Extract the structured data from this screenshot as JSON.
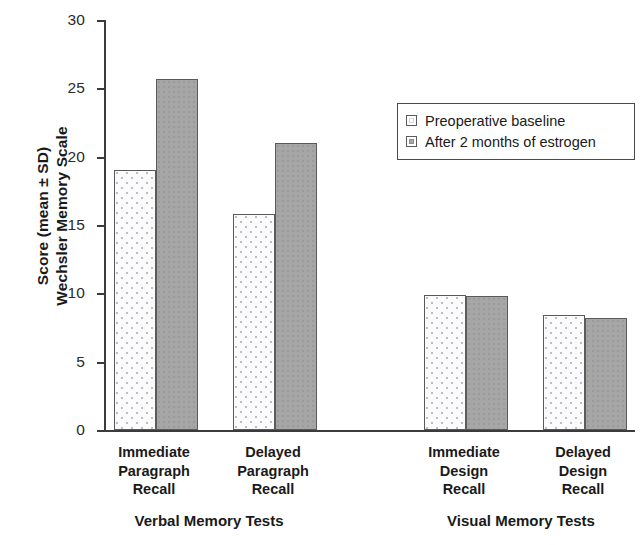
{
  "chart_data": {
    "type": "bar",
    "title": "",
    "xlabel": "",
    "ylabel_lines": [
      "Score (mean ± SD)",
      "Wechsler Memory Scale"
    ],
    "ylim": [
      0,
      30
    ],
    "yticks": [
      0,
      5,
      10,
      15,
      20,
      25,
      30
    ],
    "ytick_labels": [
      "0",
      "5",
      "10",
      "15",
      "20",
      "25",
      "30"
    ],
    "grid": false,
    "legend_position": "upper right",
    "categories": [
      "Immediate Paragraph Recall",
      "Delayed Paragraph Recall",
      "Immediate Design Recall",
      "Delayed Design Recall"
    ],
    "category_label_lines": [
      [
        "Immediate",
        "Paragraph",
        "Recall"
      ],
      [
        "Delayed",
        "Paragraph",
        "Recall"
      ],
      [
        "Immediate",
        "Design",
        "Recall"
      ],
      [
        "Delayed",
        "Design",
        "Recall"
      ]
    ],
    "groups": [
      {
        "name": "Verbal Memory Tests",
        "categories": [
          0,
          1
        ]
      },
      {
        "name": "Visual Memory Tests",
        "categories": [
          2,
          3
        ]
      }
    ],
    "series": [
      {
        "name": "Preoperative baseline",
        "key": "baseline",
        "color": "#fbfbfb",
        "values": [
          19.0,
          15.8,
          9.9,
          8.4
        ]
      },
      {
        "name": "After 2 months of estrogen",
        "key": "estrogen",
        "color": "#a6a6a6",
        "values": [
          25.7,
          21.0,
          9.8,
          8.2
        ]
      }
    ]
  },
  "legend": {
    "items": [
      {
        "label": "Preoperative baseline",
        "swatch": "light-dotted-square"
      },
      {
        "label": "After 2 months of estrogen",
        "swatch": "gray-square"
      }
    ]
  },
  "axes": {
    "y_title_line1": "Score (mean ± SD)",
    "y_title_line2": "Wechsler Memory Scale",
    "y_ticks": [
      "30",
      "25",
      "20",
      "15",
      "10",
      "5",
      "0"
    ]
  },
  "x_categories": [
    {
      "line1": "Immediate",
      "line2": "Paragraph",
      "line3": "Recall"
    },
    {
      "line1": "Delayed",
      "line2": "Paragraph",
      "line3": "Recall"
    },
    {
      "line1": "Immediate",
      "line2": "Design",
      "line3": "Recall"
    },
    {
      "line1": "Delayed",
      "line2": "Design",
      "line3": "Recall"
    }
  ],
  "x_groups": [
    {
      "label": "Verbal Memory Tests"
    },
    {
      "label": "Visual Memory Tests"
    }
  ]
}
